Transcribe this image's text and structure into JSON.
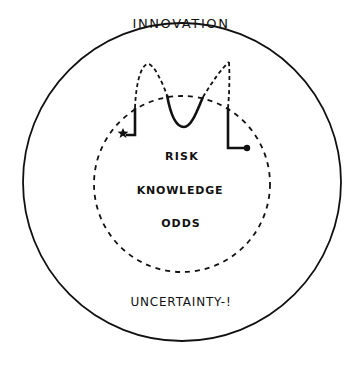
{
  "diagram": {
    "outer_circle": {
      "label": "UNCERTAINTY-!",
      "style": "solid"
    },
    "inner_circle": {
      "style": "dashed",
      "labels": [
        "RISK",
        "KNOWLEDGE",
        "ODDS"
      ]
    },
    "top_label": "INNOVATION",
    "path": {
      "start_marker": "star",
      "end_marker": "dot",
      "description": "Solid path segments inside the dashed circle, connected by dashed arcs rising toward INNOVATION"
    }
  },
  "labels": {
    "innovation": "INNOVATION",
    "risk": "RISK",
    "knowledge": "KNOWLEDGE",
    "odds": "ODDS",
    "uncertainty": "UNCERTAINTY-!"
  },
  "colors": {
    "ink": "#111111",
    "background": "#ffffff"
  }
}
